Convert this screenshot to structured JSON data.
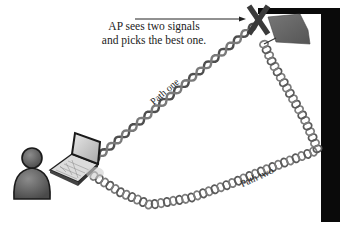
{
  "diagram": {
    "caption": {
      "line1": "AP sees two signals",
      "line2": "and picks the best one."
    },
    "paths": [
      {
        "label": "Path one",
        "style": "twisted-helix-dark"
      },
      {
        "label": "Path two",
        "style": "twisted-helix-rings"
      }
    ],
    "nodes": {
      "user": "person-icon",
      "client": "laptop-icon",
      "access_point": "access-point-icon",
      "reception_mark": "x-mark-icon",
      "reflector": "wall"
    },
    "colors": {
      "helix_dark": "#555555",
      "helix_light": "#8a8a8a",
      "wall": "#0a0a0a",
      "access_point": "#5e5e5e",
      "person": "#5a5a5a",
      "text": "#222222"
    }
  }
}
